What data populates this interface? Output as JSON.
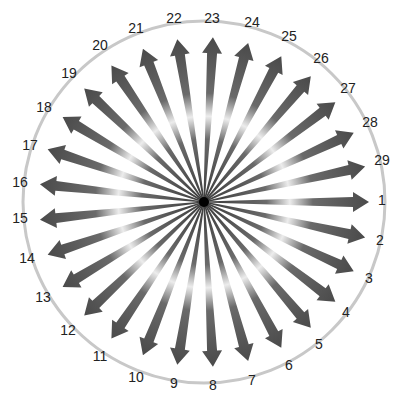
{
  "diagram": {
    "type": "radial-arrow-burst",
    "arrow_count": 29,
    "center": [
      204,
      202
    ],
    "circle_radius": 181,
    "arrow_length": 165,
    "start_angle_deg": 0,
    "direction": "clockwise",
    "colors": {
      "arrow_dark": "#4a4a4a",
      "arrow_highlight": "#e8e8e8",
      "circle": "#c8c8c8",
      "hub": "#000000",
      "label": "#222222"
    },
    "labels": [
      {
        "text": "1",
        "x": 382,
        "y": 200
      },
      {
        "text": "2",
        "x": 380,
        "y": 240
      },
      {
        "text": "3",
        "x": 369,
        "y": 278
      },
      {
        "text": "4",
        "x": 346,
        "y": 312
      },
      {
        "text": "5",
        "x": 319,
        "y": 344
      },
      {
        "text": "6",
        "x": 289,
        "y": 365
      },
      {
        "text": "7",
        "x": 252,
        "y": 380
      },
      {
        "text": "8",
        "x": 213,
        "y": 385
      },
      {
        "text": "9",
        "x": 174,
        "y": 383
      },
      {
        "text": "10",
        "x": 136,
        "y": 377
      },
      {
        "text": "11",
        "x": 100,
        "y": 356
      },
      {
        "text": "12",
        "x": 68,
        "y": 330
      },
      {
        "text": "13",
        "x": 43,
        "y": 297
      },
      {
        "text": "14",
        "x": 27,
        "y": 258
      },
      {
        "text": "15",
        "x": 20,
        "y": 218
      },
      {
        "text": "16",
        "x": 20,
        "y": 182
      },
      {
        "text": "17",
        "x": 30,
        "y": 145
      },
      {
        "text": "18",
        "x": 44,
        "y": 107
      },
      {
        "text": "19",
        "x": 69,
        "y": 73
      },
      {
        "text": "20",
        "x": 100,
        "y": 45
      },
      {
        "text": "21",
        "x": 136,
        "y": 28
      },
      {
        "text": "22",
        "x": 174,
        "y": 18
      },
      {
        "text": "23",
        "x": 212,
        "y": 18
      },
      {
        "text": "24",
        "x": 252,
        "y": 22
      },
      {
        "text": "25",
        "x": 289,
        "y": 36
      },
      {
        "text": "26",
        "x": 321,
        "y": 58
      },
      {
        "text": "27",
        "x": 348,
        "y": 88
      },
      {
        "text": "28",
        "x": 370,
        "y": 122
      },
      {
        "text": "29",
        "x": 382,
        "y": 160
      }
    ]
  }
}
